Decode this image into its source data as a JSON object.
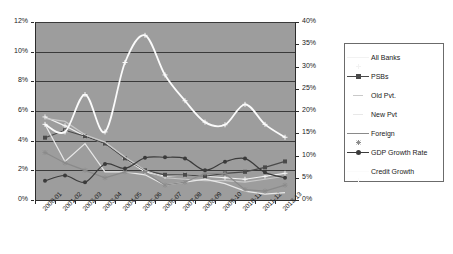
{
  "chart_data": {
    "type": "line",
    "title": "",
    "xlabel": "",
    "ylabel": "",
    "categories": [
      "2000-01",
      "2001-02",
      "2002-03",
      "2003-04",
      "2004-05",
      "2005-06",
      "2006-07",
      "2007-08",
      "2008-09",
      "2009-10",
      "2010-11",
      "2011-12",
      "2012-13"
    ],
    "axes": {
      "left": {
        "label": "",
        "ticks": [
          "0%",
          "2%",
          "4%",
          "6%",
          "8%",
          "10%",
          "12%"
        ],
        "values": [
          0,
          2,
          4,
          6,
          8,
          10,
          12
        ],
        "min": 0,
        "max": 12,
        "step": 2
      },
      "right": {
        "label": "",
        "ticks": [
          "0%",
          "5%",
          "10%",
          "15%",
          "20%",
          "25%",
          "30%",
          "35%",
          "40%"
        ],
        "values": [
          0,
          5,
          10,
          15,
          20,
          25,
          30,
          35,
          40
        ],
        "min": 0,
        "max": 40,
        "step": 5
      }
    },
    "grid": true,
    "legend_position": "right",
    "plot_background": "#9d9d9d",
    "series": [
      {
        "name": "All Banks",
        "axis": "left",
        "color": "#f2f2f2",
        "marker": "plus",
        "values": [
          5.6,
          5.0,
          4.3,
          3.8,
          2.8,
          1.9,
          1.6,
          1.7,
          1.6,
          1.5,
          1.4,
          1.6,
          1.8
        ]
      },
      {
        "name": "PSBs",
        "axis": "left",
        "color": "#4a4a4a",
        "marker": "square",
        "values": [
          4.2,
          4.7,
          4.3,
          3.8,
          2.8,
          2.0,
          1.7,
          1.7,
          1.6,
          1.8,
          1.9,
          2.2,
          2.6
        ]
      },
      {
        "name": "Old Pvt.",
        "axis": "left",
        "color": "#c9c9c9",
        "marker": "none",
        "values": [
          5.5,
          5.3,
          4.4,
          3.9,
          2.9,
          2.0,
          1.5,
          1.4,
          1.3,
          1.3,
          1.2,
          1.4,
          1.6
        ]
      },
      {
        "name": "New Pvt",
        "axis": "left",
        "color": "#e8e8e8",
        "marker": "none",
        "values": [
          5.1,
          2.6,
          3.8,
          1.9,
          1.9,
          1.7,
          1.0,
          1.2,
          1.4,
          1.1,
          0.6,
          0.4,
          0.5
        ]
      },
      {
        "name": "Foreign",
        "axis": "left",
        "color": "#8a8a8a",
        "marker": "star",
        "values": [
          3.2,
          2.5,
          2.0,
          1.5,
          1.9,
          1.9,
          1.0,
          1.2,
          1.8,
          1.8,
          0.7,
          0.6,
          1.0
        ]
      },
      {
        "name": "GDP Growth Rate",
        "axis": "right",
        "color": "#3b3b3b",
        "marker": "circle",
        "values": [
          4.3,
          5.5,
          4.0,
          8.1,
          7.1,
          9.5,
          9.6,
          9.3,
          6.7,
          8.6,
          9.3,
          6.2,
          5.0
        ]
      },
      {
        "name": "Credit Growth",
        "axis": "right",
        "color": "#fbfbfb",
        "marker": "plus",
        "values": [
          17.0,
          15.3,
          23.7,
          15.3,
          30.9,
          37.0,
          28.1,
          22.3,
          17.5,
          16.9,
          21.5,
          17.0,
          14.1
        ]
      }
    ]
  },
  "legend": {
    "items": [
      {
        "label": "All Banks"
      },
      {
        "label": "PSBs"
      },
      {
        "label": "Old Pvt."
      },
      {
        "label": "New Pvt"
      },
      {
        "label": "Foreign"
      },
      {
        "label": "GDP Growth Rate"
      },
      {
        "label": "Credit Growth"
      }
    ]
  }
}
